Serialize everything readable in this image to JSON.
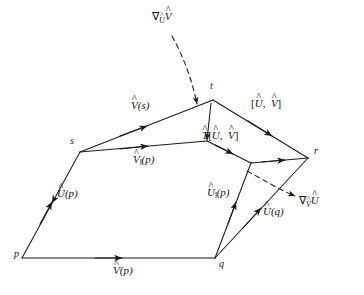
{
  "figure": {
    "background_color": "#ffffff",
    "line_color": "#1a1a1a",
    "vertices": [
      {
        "id": "p",
        "label": "p",
        "x": 22,
        "y": 258
      },
      {
        "id": "q",
        "label": "q",
        "x": 215,
        "y": 258
      },
      {
        "id": "s",
        "label": "s",
        "x": 80,
        "y": 152
      },
      {
        "id": "t",
        "label": "t",
        "x": 213,
        "y": 100
      },
      {
        "id": "r",
        "label": "r",
        "x": 308,
        "y": 158
      }
    ],
    "vertex_labels": [
      {
        "name": "vertex-label-p",
        "text": "p",
        "x": 14,
        "y": 252
      },
      {
        "name": "vertex-label-q",
        "text": "q",
        "x": 219,
        "y": 261
      },
      {
        "name": "vertex-label-s",
        "text": "s",
        "x": 70,
        "y": 138
      },
      {
        "name": "vertex-label-t",
        "text": "t",
        "x": 210,
        "y": 83
      },
      {
        "name": "vertex-label-r",
        "text": "r",
        "x": 314,
        "y": 148
      }
    ],
    "field_labels": [
      {
        "name": "label-grad-u-v",
        "base": "V",
        "nabla": true,
        "nabla_sub": "U",
        "args": "",
        "par": false,
        "x": 152,
        "y": 12
      },
      {
        "name": "label-grad-v-u",
        "base": "U",
        "nabla": true,
        "nabla_sub": "V",
        "args": "",
        "par": false,
        "x": 299,
        "y": 196
      },
      {
        "name": "label-v-of-s",
        "base": "V",
        "nabla": false,
        "nabla_sub": "",
        "args": "(s)",
        "par": false,
        "x": 131,
        "y": 101
      },
      {
        "name": "label-v-par-of-p",
        "base": "V",
        "nabla": false,
        "nabla_sub": "",
        "args": "(p)",
        "par": true,
        "x": 133,
        "y": 155
      },
      {
        "name": "label-u-of-p",
        "base": "U",
        "nabla": false,
        "nabla_sub": "",
        "args": "(p)",
        "par": false,
        "x": 57,
        "y": 189
      },
      {
        "name": "label-u-par-of-p",
        "base": "U",
        "nabla": false,
        "nabla_sub": "",
        "args": "(p)",
        "par": true,
        "x": 207,
        "y": 188
      },
      {
        "name": "label-u-of-q",
        "base": "U",
        "nabla": false,
        "nabla_sub": "",
        "args": "(q)",
        "par": false,
        "x": 263,
        "y": 207
      },
      {
        "name": "label-v-of-p",
        "base": "V",
        "nabla": false,
        "nabla_sub": "",
        "args": "(p)",
        "par": false,
        "x": 113,
        "y": 266
      }
    ],
    "bracket_labels": [
      {
        "name": "label-commutator-uv",
        "prefix": "",
        "first": "U",
        "second": "V",
        "x": 251,
        "y": 99
      },
      {
        "name": "label-torsion-uv",
        "prefix": "T",
        "first": "U",
        "second": "V",
        "x": 202,
        "y": 131
      }
    ],
    "glyphs": {
      "nabla": "∇",
      "hat": "^",
      "parallel": "‖",
      "bracket_open": "[",
      "bracket_close": "]",
      "comma": ","
    },
    "edges": [
      {
        "name": "edge-p-to-q",
        "from": "p",
        "to": "q",
        "style": "solid",
        "arrow": "mid"
      },
      {
        "name": "edge-p-to-s",
        "from": "p",
        "to": "s",
        "style": "solid",
        "arrow": "mid"
      },
      {
        "name": "edge-s-to-t",
        "from": "s",
        "to": "t",
        "style": "solid",
        "arrow": "mid"
      },
      {
        "name": "edge-s-to-m",
        "from": "s",
        "to": "m",
        "style": "solid",
        "arrow": "mid"
      },
      {
        "name": "edge-t-to-m",
        "from": "t",
        "to": "m",
        "style": "solid",
        "arrow": "end"
      },
      {
        "name": "edge-t-to-r",
        "from": "t",
        "to": "r",
        "style": "solid",
        "arrow": "mid"
      },
      {
        "name": "edge-m-to-n",
        "from": "m",
        "to": "n",
        "style": "solid",
        "arrow": "mid"
      },
      {
        "name": "edge-n-to-r",
        "from": "n",
        "to": "r",
        "style": "solid",
        "arrow": "mid"
      },
      {
        "name": "edge-q-to-n",
        "from": "q",
        "to": "n",
        "style": "solid",
        "arrow": "mid"
      },
      {
        "name": "edge-q-to-r",
        "from": "q",
        "to": "r",
        "style": "solid",
        "arrow": "mid"
      },
      {
        "name": "leader-grad-u-v",
        "style": "dashed",
        "arrow": "end"
      },
      {
        "name": "leader-grad-v-u",
        "style": "dashed",
        "arrow": "end"
      }
    ]
  }
}
